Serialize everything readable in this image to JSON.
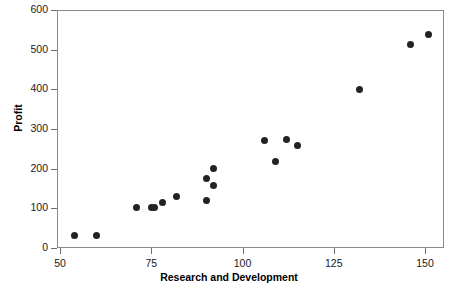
{
  "chart_data": {
    "type": "scatter",
    "title": "",
    "xlabel": "Research and Development",
    "ylabel": "Profit",
    "xlim": [
      48,
      155
    ],
    "ylim": [
      0,
      610
    ],
    "xticks": [
      50,
      75,
      100,
      125,
      150
    ],
    "xtick_labels": [
      "50",
      "75",
      "100",
      "125",
      "150"
    ],
    "yticks": [
      0,
      100,
      200,
      300,
      400,
      500,
      600
    ],
    "ytick_labels": [
      "0",
      "100",
      "200",
      "300",
      "400",
      "500",
      "600"
    ],
    "grid": false,
    "legend": null,
    "marker": {
      "shape": "circle",
      "color": "#232323",
      "size_px": 7
    },
    "n_points": 20,
    "points": [
      {
        "x": 54,
        "y": 32
      },
      {
        "x": 60,
        "y": 32
      },
      {
        "x": 71,
        "y": 102
      },
      {
        "x": 75,
        "y": 101
      },
      {
        "x": 76,
        "y": 101
      },
      {
        "x": 78,
        "y": 114
      },
      {
        "x": 82,
        "y": 130
      },
      {
        "x": 90,
        "y": 120
      },
      {
        "x": 90,
        "y": 174
      },
      {
        "x": 92,
        "y": 158
      },
      {
        "x": 92,
        "y": 201
      },
      {
        "x": 106,
        "y": 272
      },
      {
        "x": 109,
        "y": 217
      },
      {
        "x": 112,
        "y": 273
      },
      {
        "x": 115,
        "y": 258
      },
      {
        "x": 132,
        "y": 399
      },
      {
        "x": 146,
        "y": 512
      },
      {
        "x": 151,
        "y": 538
      }
    ],
    "colors": {
      "marker": "#232323",
      "frame": "#8a8a8a",
      "tick": "#6e6e6e",
      "text": "#1a1a1a",
      "background": "#ffffff"
    }
  }
}
